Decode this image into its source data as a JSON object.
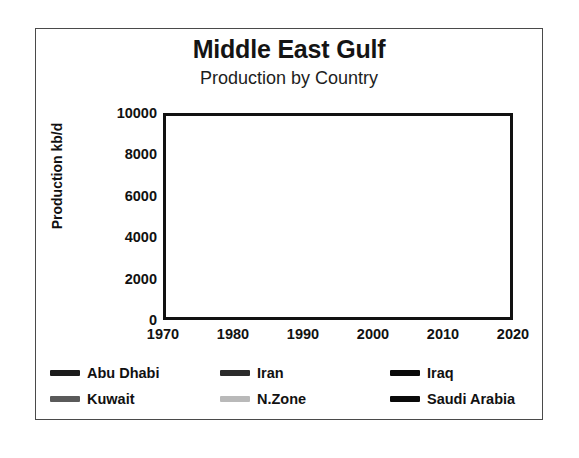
{
  "chart_data": {
    "type": "line",
    "title": "Middle East Gulf",
    "subtitle": "Production by Country",
    "xlabel": "",
    "ylabel": "Production kb/d",
    "xlim": [
      1970,
      2020
    ],
    "ylim": [
      0,
      10000
    ],
    "xticks": [
      1970,
      1980,
      1990,
      2000,
      2010,
      2020
    ],
    "yticks": [
      0,
      2000,
      4000,
      6000,
      8000,
      10000
    ],
    "xminor_step": 1,
    "yminor_step": 1000,
    "grid": true,
    "legend_position": "below",
    "x": [
      1970,
      1971,
      1972,
      1973,
      1974,
      1975,
      1976,
      1977,
      1978,
      1979,
      1980,
      1981,
      1982,
      1983,
      1984,
      1985,
      1986,
      1987,
      1988,
      1989,
      1990,
      1991,
      1992,
      1993,
      1994,
      1995,
      1996,
      1997,
      1998,
      1999,
      2000,
      2001,
      2002,
      2003,
      2004,
      2005,
      2006,
      2007,
      2008,
      2009,
      2010,
      2011,
      2012,
      2013,
      2014,
      2015,
      2016,
      2017,
      2018,
      2019,
      2020
    ],
    "series": [
      {
        "name": "Abu Dhabi",
        "color": "#1c1c1c",
        "values": [
          700,
          950,
          1050,
          1300,
          1420,
          1400,
          1600,
          1650,
          1450,
          1450,
          1350,
          1200,
          800,
          750,
          850,
          900,
          950,
          1000,
          1100,
          1500,
          1750,
          2150,
          2250,
          2250,
          2200,
          2200,
          2200,
          2250,
          2300,
          2250,
          2300,
          2200,
          2000,
          2150,
          2400,
          2500,
          2600,
          2700,
          2850,
          2550,
          2600,
          2800,
          3100,
          3000,
          3100,
          3250,
          3400,
          3300,
          3250,
          3400,
          3600
        ]
      },
      {
        "name": "Iran",
        "color": "#2b2b2b",
        "values": [
          3830,
          4540,
          5020,
          5860,
          6020,
          5350,
          5880,
          5660,
          5240,
          3170,
          1470,
          1300,
          2210,
          2440,
          2170,
          2200,
          1900,
          2300,
          2240,
          2810,
          3090,
          3310,
          3430,
          3540,
          3620,
          3640,
          3690,
          3660,
          3640,
          3400,
          3700,
          3660,
          3330,
          3750,
          3900,
          3900,
          3900,
          3850,
          3900,
          3800,
          3700,
          3600,
          3100,
          2700,
          3100,
          3400,
          3900,
          4300,
          4200,
          3200,
          2600
        ]
      },
      {
        "name": "Iraq",
        "color": "#0a0a0a",
        "values": [
          1550,
          1700,
          1470,
          2020,
          1970,
          2260,
          2420,
          2350,
          2560,
          3480,
          2650,
          900,
          1000,
          1000,
          1200,
          1430,
          1690,
          2080,
          2690,
          2780,
          2040,
          305,
          425,
          512,
          553,
          560,
          579,
          1155,
          2150,
          2510,
          2580,
          2410,
          2030,
          1340,
          2030,
          1830,
          1990,
          2150,
          2430,
          2450,
          2400,
          2650,
          3000,
          3100,
          3300,
          3900,
          4400,
          4450,
          4550,
          4700,
          4150
        ]
      },
      {
        "name": "Kuwait",
        "color": "#5a5a5a",
        "values": [
          2990,
          3200,
          3280,
          3020,
          2550,
          2080,
          2150,
          1970,
          2130,
          2500,
          1660,
          1130,
          820,
          1060,
          1150,
          1020,
          1420,
          1340,
          1490,
          1790,
          1180,
          190,
          1060,
          1880,
          2030,
          2060,
          2070,
          2100,
          2130,
          2080,
          2150,
          2120,
          1900,
          2170,
          2420,
          2530,
          2600,
          2580,
          2680,
          2340,
          2310,
          2660,
          2970,
          2930,
          2870,
          2860,
          2950,
          2700,
          2740,
          2690,
          2400
        ]
      },
      {
        "name": "N.Zone",
        "color": "#b9b9b9",
        "values": [
          420,
          470,
          500,
          520,
          490,
          430,
          440,
          450,
          460,
          500,
          480,
          400,
          330,
          340,
          370,
          380,
          390,
          400,
          410,
          420,
          400,
          180,
          250,
          330,
          370,
          390,
          400,
          410,
          420,
          410,
          420,
          410,
          390,
          400,
          420,
          430,
          440,
          450,
          460,
          440,
          450,
          470,
          490,
          500,
          500,
          490,
          250,
          120,
          110,
          180,
          320
        ]
      },
      {
        "name": "Saudi Arabia",
        "color": "#0a0a0a",
        "values": [
          3800,
          4770,
          6020,
          7600,
          8480,
          7080,
          8580,
          9250,
          8300,
          9530,
          9900,
          9820,
          6480,
          5090,
          4660,
          3390,
          5090,
          4270,
          5090,
          5100,
          6410,
          8120,
          8330,
          8200,
          8120,
          8230,
          8220,
          8360,
          8390,
          7830,
          8400,
          8030,
          7530,
          8410,
          9100,
          9550,
          9210,
          8820,
          9200,
          8250,
          8900,
          9310,
          9760,
          9640,
          9710,
          10100,
          10460,
          9960,
          10320,
          9810,
          9000
        ]
      }
    ]
  },
  "legend": {
    "items": [
      {
        "label": "Abu Dhabi",
        "color": "#1c1c1c"
      },
      {
        "label": "Iran",
        "color": "#2b2b2b"
      },
      {
        "label": "Iraq",
        "color": "#0a0a0a"
      },
      {
        "label": "Kuwait",
        "color": "#5a5a5a"
      },
      {
        "label": "N.Zone",
        "color": "#b9b9b9"
      },
      {
        "label": "Saudi Arabia",
        "color": "#0a0a0a"
      }
    ]
  }
}
